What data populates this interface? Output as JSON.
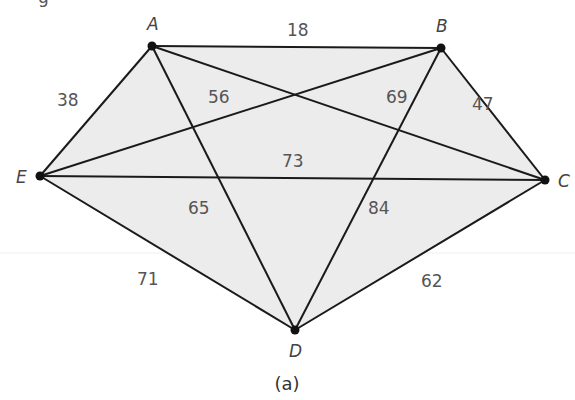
{
  "figure": {
    "caption": "(a)",
    "top_fragment": "g",
    "fill_color": "#ececec",
    "edge_color": "#1a1a1a"
  },
  "vertices": [
    {
      "id": "A",
      "label": "A",
      "x": 152,
      "y": 46,
      "lx": 147,
      "ly": 30
    },
    {
      "id": "B",
      "label": "B",
      "x": 441,
      "y": 48,
      "lx": 436,
      "ly": 32
    },
    {
      "id": "C",
      "label": "C",
      "x": 545,
      "y": 180,
      "lx": 558,
      "ly": 187
    },
    {
      "id": "D",
      "label": "D",
      "x": 295,
      "y": 330,
      "lx": 289,
      "ly": 357
    },
    {
      "id": "E",
      "label": "E",
      "x": 40,
      "y": 176,
      "lx": 16,
      "ly": 183
    }
  ],
  "edges": [
    {
      "from": "A",
      "to": "B",
      "weight": "18",
      "lx": 287,
      "ly": 36
    },
    {
      "from": "A",
      "to": "C",
      "weight": "69",
      "lx": 386,
      "ly": 103
    },
    {
      "from": "A",
      "to": "D",
      "weight": "65",
      "lx": 188,
      "ly": 214
    },
    {
      "from": "A",
      "to": "E",
      "weight": "38",
      "lx": 57,
      "ly": 106
    },
    {
      "from": "B",
      "to": "C",
      "weight": "47",
      "lx": 472,
      "ly": 110
    },
    {
      "from": "B",
      "to": "D",
      "weight": "84",
      "lx": 368,
      "ly": 214
    },
    {
      "from": "B",
      "to": "E",
      "weight": "56",
      "lx": 208,
      "ly": 103
    },
    {
      "from": "C",
      "to": "D",
      "weight": "62",
      "lx": 421,
      "ly": 287
    },
    {
      "from": "C",
      "to": "E",
      "weight": "73",
      "lx": 282,
      "ly": 167
    },
    {
      "from": "D",
      "to": "E",
      "weight": "71",
      "lx": 137,
      "ly": 285
    }
  ]
}
